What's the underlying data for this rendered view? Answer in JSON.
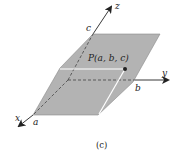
{
  "figure": {
    "caption": "(c)",
    "axes": {
      "x": "x",
      "y": "y",
      "z": "z"
    },
    "intercepts": {
      "a": "a",
      "b": "b",
      "c": "c"
    },
    "point_label": "P(a, b, c)",
    "colors": {
      "plane": "#b3b3b3",
      "plane_edge": "#8a8a8a",
      "highlight": "#ffffff",
      "axis": "#222222"
    }
  }
}
